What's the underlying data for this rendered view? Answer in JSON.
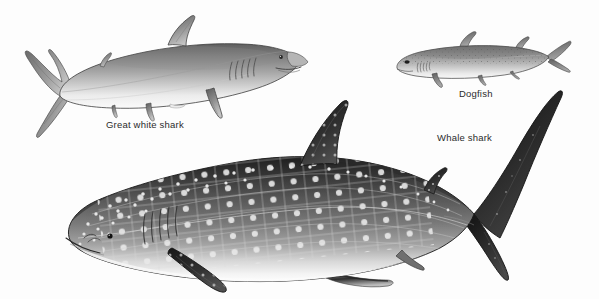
{
  "figure": {
    "kind": "scientific-illustration",
    "background_color": "#fdfdfd",
    "width": 599,
    "height": 299,
    "ink_color": "#2b2b2b"
  },
  "labels": {
    "great_white": "Great white shark",
    "dogfish": "Dogfish",
    "whale_shark": "Whale shark"
  },
  "specimens": [
    {
      "id": "great-white-shark",
      "label": "Great white shark",
      "position": "upper-left",
      "facing": "right",
      "shading": "graphite grey, pale underside, darker dorsal surface",
      "features": [
        "dorsal fin",
        "pectoral fin",
        "pelvic fin",
        "caudal fin",
        "five gill slits",
        "eye",
        "mouth"
      ],
      "colors": {
        "dorsal": "#6e6e6e",
        "mid": "#9e9e9e",
        "belly": "#f2f2f2",
        "outline": "#3a3a3a"
      }
    },
    {
      "id": "dogfish",
      "label": "Dogfish",
      "position": "upper-right",
      "facing": "left",
      "shading": "speckled grey with pale belly",
      "features": [
        "first dorsal fin",
        "second dorsal fin",
        "pectoral fin",
        "pelvic fin",
        "caudal fin",
        "gill slits",
        "eye"
      ],
      "colors": {
        "dorsal": "#7d7d7d",
        "mid": "#a8a8a8",
        "belly": "#f0f0f0",
        "outline": "#3a3a3a"
      }
    },
    {
      "id": "whale-shark",
      "label": "Whale shark",
      "position": "lower-centre",
      "facing": "left",
      "shading": "very dark grey-black back with white spot rows and pale checkerboard grid, white belly",
      "features": [
        "blunt head",
        "wide mouth",
        "eye",
        "gill slits",
        "spotted pattern",
        "checkerboard ridges",
        "large dorsal fin",
        "second dorsal fin",
        "large pectoral fin",
        "pelvic fin",
        "anal fin",
        "crescent caudal fin"
      ],
      "colors": {
        "dorsal": "#232323",
        "mid": "#5d5d5d",
        "flank": "#8a8a8a",
        "belly": "#fbfbfb",
        "spot": "#e8e8e8",
        "outline": "#1a1a1a"
      }
    }
  ]
}
